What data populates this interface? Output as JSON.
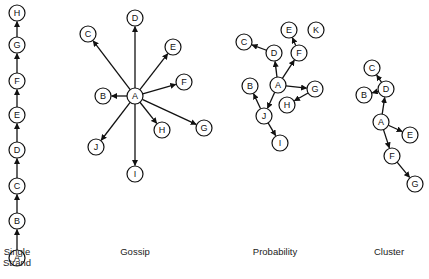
{
  "diagrams": [
    {
      "id": "single",
      "title": "Single\nStrand",
      "title_lines": [
        "Single",
        "Strand"
      ],
      "nodes": [
        {
          "id": "A",
          "x": 17,
          "y": 258
        },
        {
          "id": "B",
          "x": 17,
          "y": 221
        },
        {
          "id": "C",
          "x": 17,
          "y": 186
        },
        {
          "id": "D",
          "x": 17,
          "y": 150
        },
        {
          "id": "E",
          "x": 17,
          "y": 115
        },
        {
          "id": "F",
          "x": 17,
          "y": 81
        },
        {
          "id": "G",
          "x": 17,
          "y": 45
        },
        {
          "id": "H",
          "x": 17,
          "y": 13
        }
      ],
      "edges": [
        [
          "A",
          "B"
        ],
        [
          "B",
          "C"
        ],
        [
          "C",
          "D"
        ],
        [
          "D",
          "E"
        ],
        [
          "E",
          "F"
        ],
        [
          "F",
          "G"
        ],
        [
          "G",
          "H"
        ]
      ]
    },
    {
      "id": "gossip",
      "title": "Gossip",
      "nodes": [
        {
          "id": "A",
          "x": 135,
          "y": 96
        },
        {
          "id": "B",
          "x": 103,
          "y": 96
        },
        {
          "id": "C",
          "x": 88,
          "y": 34
        },
        {
          "id": "D",
          "x": 135,
          "y": 18
        },
        {
          "id": "E",
          "x": 173,
          "y": 47
        },
        {
          "id": "F",
          "x": 184,
          "y": 82
        },
        {
          "id": "G",
          "x": 204,
          "y": 128
        },
        {
          "id": "H",
          "x": 162,
          "y": 130
        },
        {
          "id": "I",
          "x": 135,
          "y": 174
        },
        {
          "id": "J",
          "x": 96,
          "y": 147
        }
      ],
      "edges": [
        [
          "A",
          "B"
        ],
        [
          "A",
          "C"
        ],
        [
          "A",
          "D"
        ],
        [
          "A",
          "E"
        ],
        [
          "A",
          "F"
        ],
        [
          "A",
          "G"
        ],
        [
          "A",
          "H"
        ],
        [
          "A",
          "I"
        ],
        [
          "A",
          "J"
        ]
      ]
    },
    {
      "id": "probability",
      "title": "Probability",
      "nodes": [
        {
          "id": "A",
          "x": 278,
          "y": 85
        },
        {
          "id": "B",
          "x": 250,
          "y": 86
        },
        {
          "id": "C",
          "x": 244,
          "y": 42
        },
        {
          "id": "D",
          "x": 274,
          "y": 53
        },
        {
          "id": "E",
          "x": 289,
          "y": 30
        },
        {
          "id": "F",
          "x": 299,
          "y": 53
        },
        {
          "id": "G",
          "x": 315,
          "y": 89
        },
        {
          "id": "H",
          "x": 287,
          "y": 105
        },
        {
          "id": "I",
          "x": 280,
          "y": 143
        },
        {
          "id": "J",
          "x": 264,
          "y": 116
        },
        {
          "id": "K",
          "x": 316,
          "y": 30
        }
      ],
      "edges": [
        [
          "A",
          "D"
        ],
        [
          "D",
          "C"
        ],
        [
          "A",
          "F"
        ],
        [
          "F",
          "E"
        ],
        [
          "A",
          "G"
        ],
        [
          "G",
          "H"
        ],
        [
          "A",
          "J"
        ],
        [
          "J",
          "B"
        ],
        [
          "J",
          "I"
        ]
      ]
    },
    {
      "id": "cluster",
      "title": "Cluster",
      "nodes": [
        {
          "id": "A",
          "x": 381,
          "y": 122
        },
        {
          "id": "B",
          "x": 364,
          "y": 95
        },
        {
          "id": "C",
          "x": 372,
          "y": 68
        },
        {
          "id": "D",
          "x": 386,
          "y": 89
        },
        {
          "id": "E",
          "x": 410,
          "y": 135
        },
        {
          "id": "F",
          "x": 392,
          "y": 156
        },
        {
          "id": "G",
          "x": 415,
          "y": 184
        }
      ],
      "edges": [
        [
          "A",
          "D"
        ],
        [
          "D",
          "C"
        ],
        [
          "D",
          "B"
        ],
        [
          "A",
          "E"
        ],
        [
          "A",
          "F"
        ],
        [
          "F",
          "G"
        ]
      ]
    }
  ],
  "labels": {
    "single_line1": "Single",
    "single_line2": "Strand",
    "gossip": "Gossip",
    "probability": "Probability",
    "cluster": "Cluster"
  },
  "style": {
    "node_radius": 8,
    "stroke": "#111111",
    "fill": "#ffffff"
  }
}
